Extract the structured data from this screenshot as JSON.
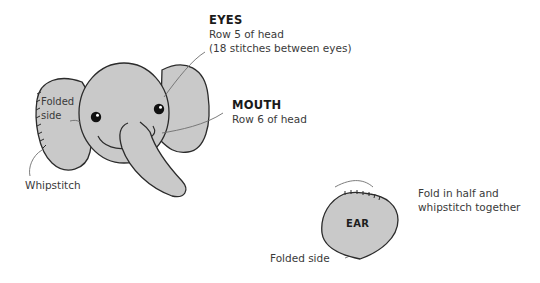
{
  "colors": {
    "fill": "#c9c9c9",
    "outline": "#2b2b2b",
    "leader_line": "#6e6e6e",
    "text": "#3a3a3a"
  },
  "eyes": {
    "heading": "EYES",
    "line1": "Row 5 of head",
    "line2": "(18 stitches between eyes)"
  },
  "mouth": {
    "heading": "MOUTH",
    "line1": "Row 6 of head"
  },
  "folded_side_head": {
    "line1": "Folded",
    "line2": "side"
  },
  "whipstitch": {
    "label": "Whipstitch"
  },
  "ear": {
    "label": "EAR",
    "fold_line1": "Fold in half and",
    "fold_line2": "whipstitch together",
    "folded_side": "Folded side"
  }
}
